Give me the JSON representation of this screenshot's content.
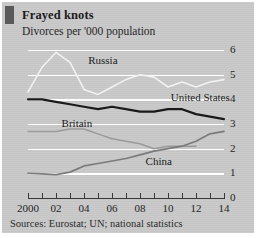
{
  "figure": {
    "title": "Frayed knots",
    "subtitle": "Divorces per '000 population",
    "sources": "Sources: Eurostat; UN; national statistics",
    "tab_mark_color": "#5a5a5a",
    "panel_color": "#c9c9c9",
    "gridline_color": "#ffffff"
  },
  "chart_data": {
    "type": "line",
    "title": "Frayed knots",
    "subtitle": "Divorces per '000 population",
    "xlabel": "",
    "ylabel": "Divorces per '000 population",
    "ylim": [
      0,
      6
    ],
    "xlim": [
      2000,
      2014
    ],
    "yticks": [
      0,
      1,
      2,
      3,
      4,
      5,
      6
    ],
    "ytick_labels": [
      "0",
      "1",
      "2",
      "3",
      "4",
      "5",
      "6"
    ],
    "y_axis_position": "right",
    "grid": "horizontal",
    "legend": "inline-labels",
    "x": [
      2000,
      2001,
      2002,
      2003,
      2004,
      2005,
      2006,
      2007,
      2008,
      2009,
      2010,
      2011,
      2012,
      2013,
      2014
    ],
    "xtick_labels": [
      "2000",
      "02",
      "04",
      "06",
      "08",
      "10",
      "12",
      "14"
    ],
    "xtick_values": [
      2000,
      2002,
      2004,
      2006,
      2008,
      2010,
      2012,
      2014
    ],
    "series": [
      {
        "name": "Russia",
        "color": "#f2f2f2",
        "width": 1.6,
        "values": [
          4.3,
          5.3,
          5.9,
          5.5,
          4.4,
          4.2,
          4.5,
          4.8,
          5.0,
          4.9,
          4.5,
          4.7,
          4.5,
          4.7,
          4.8
        ]
      },
      {
        "name": "United States",
        "color": "#1a1a1a",
        "width": 2.2,
        "values": [
          4.0,
          4.0,
          3.9,
          3.8,
          3.7,
          3.6,
          3.7,
          3.6,
          3.5,
          3.5,
          3.6,
          3.6,
          3.4,
          3.3,
          3.2
        ]
      },
      {
        "name": "Britain",
        "color": "#9a9a9a",
        "width": 1.5,
        "values": [
          2.7,
          2.7,
          2.7,
          2.8,
          2.8,
          2.6,
          2.4,
          2.3,
          2.2,
          2.0,
          2.1,
          2.1,
          2.1,
          null,
          null
        ]
      },
      {
        "name": "China",
        "color": "#7b7b7b",
        "width": 1.7,
        "values": [
          1.0,
          0.98,
          0.95,
          1.05,
          1.3,
          1.4,
          1.5,
          1.6,
          1.75,
          1.9,
          2.0,
          2.1,
          2.3,
          2.6,
          2.7
        ]
      }
    ],
    "annotations": [
      {
        "text": "Russia",
        "x": 2004.3,
        "y": 5.55
      },
      {
        "text": "United States",
        "x": 2010.2,
        "y": 4.05
      },
      {
        "text": "Britain",
        "x": 2002.4,
        "y": 3.0
      },
      {
        "text": "China",
        "x": 2008.4,
        "y": 1.45
      }
    ]
  }
}
